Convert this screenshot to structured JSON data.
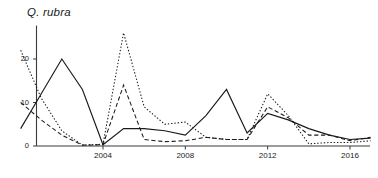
{
  "chart_data": {
    "type": "line",
    "title": "Q. rubra",
    "xlabel": "",
    "ylabel": "",
    "xlim": [
      2000,
      2017
    ],
    "ylim": [
      0,
      27
    ],
    "grid": false,
    "legend": "none",
    "yticks": [
      0,
      10,
      20
    ],
    "ytick_labels": [
      "0",
      "10",
      "20"
    ],
    "xticks": [
      2004,
      2008,
      2012,
      2016
    ],
    "xtick_labels": [
      "2004",
      "2008",
      "2012",
      "2016"
    ],
    "x": [
      2000,
      2001,
      2002,
      2003,
      2004,
      2005,
      2006,
      2007,
      2008,
      2009,
      2010,
      2011,
      2012,
      2013,
      2014,
      2015,
      2016,
      2017
    ],
    "series": [
      {
        "name": "series-solid",
        "style": "solid",
        "values": [
          4,
          12,
          20,
          13,
          0.3,
          4,
          4,
          3.5,
          2.5,
          7,
          13,
          3,
          7.5,
          6,
          4,
          2.5,
          1.5,
          1.8
        ]
      },
      {
        "name": "series-dotted",
        "style": "dotted",
        "values": [
          22,
          11,
          3.5,
          0.2,
          0.4,
          26,
          9,
          5,
          5.5,
          2,
          1.5,
          1.5,
          12,
          7,
          0.5,
          0.8,
          0.8,
          1.2
        ]
      },
      {
        "name": "series-dashed",
        "style": "dashed",
        "values": [
          10,
          6,
          2.5,
          0.2,
          0.3,
          14,
          1.5,
          1,
          1.2,
          2,
          1.5,
          1.5,
          9,
          6.5,
          2.5,
          2.5,
          1.2,
          2.0
        ]
      }
    ]
  },
  "axes": {
    "axis_color": "#3a3a3a",
    "line_color": "#1a1a1a"
  }
}
